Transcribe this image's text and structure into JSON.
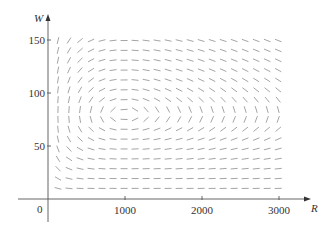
{
  "chart_data": {
    "type": "direction_field",
    "title": "",
    "xlabel": "R",
    "ylabel": "W",
    "origin_label": "0",
    "xlim": [
      0,
      3150
    ],
    "ylim": [
      0,
      160
    ],
    "x_ticks": [
      1000,
      2000,
      3000
    ],
    "x_tick_labels": [
      "1000",
      "2000",
      "3000"
    ],
    "y_ticks": [
      50,
      100,
      150
    ],
    "y_tick_labels": [
      "50",
      "100",
      "150"
    ],
    "grid": false,
    "legend": null,
    "system": {
      "dR_dt": "0.08 R - 0.001 R W",
      "dW_dt": "-0.02 W + 0.00002 R W",
      "coefficients": {
        "a": 0.08,
        "b": 0.001,
        "c": 0.02,
        "d": 2e-05
      }
    },
    "equilibrium": {
      "R": 1000,
      "W": 80
    },
    "field_sample_grid": {
      "R_start": 130,
      "R_step": 143,
      "R_count": 21,
      "W_start": 10,
      "W_step": 9.3,
      "W_count": 16
    }
  },
  "colors": {
    "axis": "#555555",
    "segment": "#9a9a9a",
    "text": "#333333"
  },
  "layout": {
    "origin_px": [
      48,
      199
    ],
    "px_per_R": 0.077,
    "px_per_W": 1.06,
    "segment_length_px": 7
  }
}
